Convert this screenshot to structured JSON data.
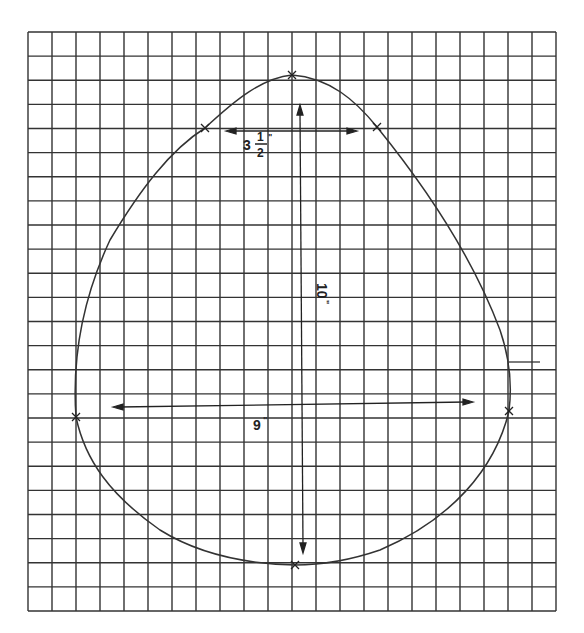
{
  "diagram": {
    "grid": {
      "left": 28,
      "top": 32,
      "right": 556,
      "bottom": 611,
      "columns": 22,
      "rows": 24,
      "line_color": "#333333"
    },
    "shape": {
      "description": "egg / teardrop outline pattern",
      "stroke_color": "#333333",
      "points": {
        "top": [
          292,
          75
        ],
        "upper_left": [
          205,
          128
        ],
        "upper_right": [
          377,
          127
        ],
        "left": [
          76,
          417
        ],
        "right": [
          509,
          411
        ],
        "bottom": [
          295,
          565
        ]
      }
    },
    "dimensions": {
      "top_width": {
        "whole": "3",
        "numerator": "1",
        "denominator": "2",
        "unit": "\""
      },
      "height": {
        "value": "10",
        "unit": "\""
      },
      "width": {
        "value": "9",
        "unit": "\""
      }
    }
  }
}
